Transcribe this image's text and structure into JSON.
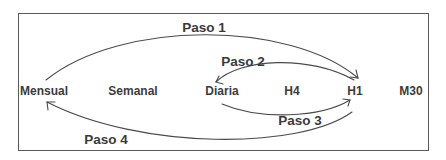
{
  "diagram": {
    "nodes": [
      {
        "id": "mensual",
        "label": "Mensual"
      },
      {
        "id": "semanal",
        "label": "Semanal"
      },
      {
        "id": "diaria",
        "label": "Diaria"
      },
      {
        "id": "h4",
        "label": "H4"
      },
      {
        "id": "h1",
        "label": "H1"
      },
      {
        "id": "m30",
        "label": "M30"
      }
    ],
    "steps": [
      {
        "label": "Paso 1",
        "from": "Mensual",
        "to": "H1"
      },
      {
        "label": "Paso 2",
        "from": "H1",
        "to": "Diaria"
      },
      {
        "label": "Paso 3",
        "from": "Diaria",
        "to": "H1"
      },
      {
        "label": "Paso 4",
        "from": "H1",
        "to": "Mensual"
      }
    ],
    "colors": {
      "line": "#4a4a4a",
      "text": "#3c3c3c",
      "border": "#5a5a5a"
    }
  }
}
